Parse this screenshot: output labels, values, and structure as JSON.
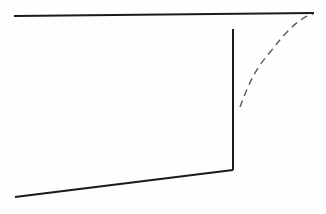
{
  "canvas": {
    "width": 326,
    "height": 214,
    "background_color": "#fefefe"
  },
  "chart_data": {
    "type": "line",
    "title": "",
    "subtitle": "",
    "xlabel": "",
    "ylabel": "",
    "grid": false,
    "legend": "none",
    "axis_visible": false,
    "tick_labels_x": [],
    "tick_labels_y": [],
    "xlim": [
      0,
      326
    ],
    "ylim": [
      0,
      214
    ],
    "annotations": [],
    "series": [
      {
        "name": "upper-boundary-line",
        "style": "solid",
        "color": "#1a1a1a",
        "width": 2,
        "points": [
          [
            14,
            16
          ],
          [
            314,
            13
          ]
        ]
      },
      {
        "name": "vertical-drop-line",
        "style": "solid",
        "color": "#1a1a1a",
        "width": 2,
        "points": [
          [
            233,
            29
          ],
          [
            233,
            170
          ]
        ]
      },
      {
        "name": "lower-boundary-line",
        "style": "solid",
        "color": "#1a1a1a",
        "width": 2,
        "points": [
          [
            233,
            170
          ],
          [
            15,
            197
          ]
        ]
      },
      {
        "name": "dashed-transition-curve",
        "style": "dashed",
        "color": "#5a5a5a",
        "width": 1.4,
        "dash_pattern": [
          7,
          5
        ],
        "points": [
          [
            240,
            107
          ],
          [
            248,
            87
          ],
          [
            258,
            68
          ],
          [
            271,
            51
          ],
          [
            287,
            32
          ],
          [
            302,
            19
          ],
          [
            313,
            14
          ]
        ]
      }
    ]
  },
  "elements": {
    "upper_line_label": "",
    "vertical_line_label": "",
    "lower_line_label": "",
    "dashed_curve_label": ""
  }
}
